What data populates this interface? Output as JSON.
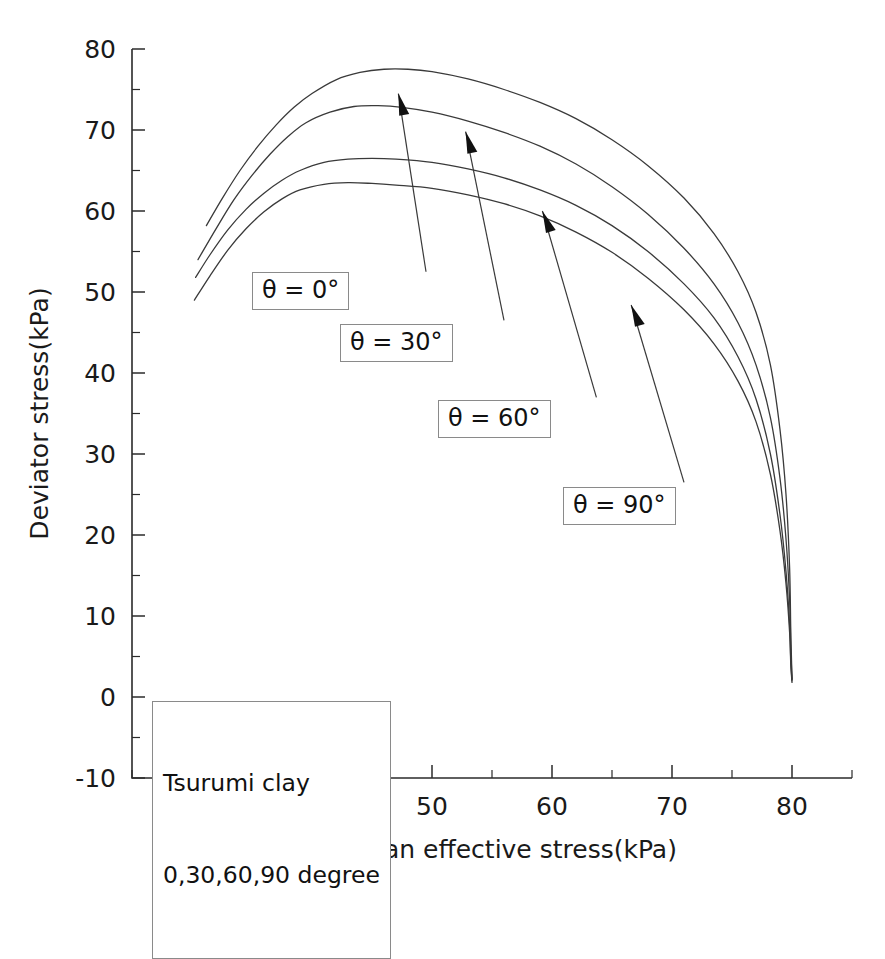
{
  "chart_data": {
    "type": "line",
    "title": "",
    "xlabel": "Mean effective stress(kPa)",
    "ylabel": "Deviator stress(kPa)",
    "xlim": [
      25,
      85
    ],
    "ylim": [
      -10,
      80
    ],
    "xticks": [
      30,
      40,
      50,
      60,
      70,
      80
    ],
    "yticks": [
      -10,
      0,
      10,
      20,
      30,
      40,
      50,
      60,
      70,
      80
    ],
    "xtick_labels": [
      "30",
      "40",
      "50",
      "60",
      "70",
      "80"
    ],
    "ytick_labels": [
      "-10",
      "0",
      "10",
      "20",
      "30",
      "40",
      "50",
      "60",
      "70",
      "80"
    ],
    "xminor_step": 5,
    "yminor_step": 5,
    "grid": false,
    "legend_position": "none",
    "line_color": "#3a3a3a",
    "series": [
      {
        "name": "theta = 0 degree",
        "label": "θ = 0°",
        "peak": {
          "x": 47.5,
          "y": 77.5
        },
        "points": [
          [
            31.2,
            58.2
          ],
          [
            32.5,
            61.5
          ],
          [
            34.0,
            65.0
          ],
          [
            35.5,
            68.0
          ],
          [
            37.0,
            70.6
          ],
          [
            38.5,
            72.8
          ],
          [
            40.0,
            74.5
          ],
          [
            42.0,
            76.2
          ],
          [
            44.0,
            77.1
          ],
          [
            46.0,
            77.5
          ],
          [
            48.0,
            77.5
          ],
          [
            50.0,
            77.2
          ],
          [
            53.0,
            76.3
          ],
          [
            56.0,
            75.0
          ],
          [
            59.0,
            73.4
          ],
          [
            62.0,
            71.4
          ],
          [
            65.0,
            68.8
          ],
          [
            68.0,
            65.6
          ],
          [
            71.0,
            61.6
          ],
          [
            73.5,
            57.2
          ],
          [
            75.5,
            52.5
          ],
          [
            77.0,
            47.5
          ],
          [
            78.2,
            41.0
          ],
          [
            79.0,
            33.0
          ],
          [
            79.5,
            25.0
          ],
          [
            79.8,
            16.0
          ],
          [
            79.9,
            8.0
          ],
          [
            80.0,
            2.2
          ]
        ]
      },
      {
        "name": "theta = 30 degree",
        "label": "θ = 30°",
        "peak": {
          "x": 45.5,
          "y": 73.0
        },
        "points": [
          [
            30.5,
            54.0
          ],
          [
            32.0,
            57.8
          ],
          [
            33.5,
            61.4
          ],
          [
            35.0,
            64.4
          ],
          [
            36.5,
            67.0
          ],
          [
            38.0,
            69.2
          ],
          [
            39.5,
            70.9
          ],
          [
            41.5,
            72.2
          ],
          [
            43.5,
            72.9
          ],
          [
            45.5,
            73.0
          ],
          [
            47.5,
            72.8
          ],
          [
            50.0,
            72.2
          ],
          [
            53.0,
            71.1
          ],
          [
            56.0,
            69.7
          ],
          [
            59.0,
            68.0
          ],
          [
            62.0,
            65.8
          ],
          [
            65.0,
            63.0
          ],
          [
            68.0,
            59.6
          ],
          [
            71.0,
            55.4
          ],
          [
            73.5,
            51.0
          ],
          [
            75.5,
            46.2
          ],
          [
            77.0,
            41.0
          ],
          [
            78.2,
            34.5
          ],
          [
            79.0,
            27.0
          ],
          [
            79.5,
            19.5
          ],
          [
            79.8,
            12.0
          ],
          [
            79.9,
            6.0
          ],
          [
            80.0,
            2.2
          ]
        ]
      },
      {
        "name": "theta = 60 degree",
        "label": "θ = 60°",
        "peak": {
          "x": 45.0,
          "y": 66.5
        },
        "points": [
          [
            30.3,
            51.8
          ],
          [
            31.5,
            54.6
          ],
          [
            33.0,
            57.7
          ],
          [
            34.5,
            60.2
          ],
          [
            36.0,
            62.2
          ],
          [
            37.5,
            63.8
          ],
          [
            39.0,
            65.0
          ],
          [
            41.0,
            66.0
          ],
          [
            43.0,
            66.4
          ],
          [
            45.0,
            66.5
          ],
          [
            47.0,
            66.4
          ],
          [
            50.0,
            66.0
          ],
          [
            53.0,
            65.2
          ],
          [
            56.0,
            64.1
          ],
          [
            59.0,
            62.6
          ],
          [
            62.0,
            60.7
          ],
          [
            65.0,
            58.2
          ],
          [
            68.0,
            55.0
          ],
          [
            71.0,
            51.0
          ],
          [
            73.5,
            46.8
          ],
          [
            75.5,
            42.0
          ],
          [
            77.0,
            36.8
          ],
          [
            78.2,
            30.0
          ],
          [
            79.0,
            22.5
          ],
          [
            79.5,
            15.5
          ],
          [
            79.8,
            9.0
          ],
          [
            79.9,
            4.5
          ],
          [
            80.0,
            2.0
          ]
        ]
      },
      {
        "name": "theta = 90 degree",
        "label": "θ = 90°",
        "peak": {
          "x": 43.5,
          "y": 63.5
        },
        "points": [
          [
            30.2,
            49.0
          ],
          [
            31.5,
            52.0
          ],
          [
            33.0,
            55.2
          ],
          [
            34.5,
            57.8
          ],
          [
            36.0,
            59.9
          ],
          [
            37.5,
            61.5
          ],
          [
            39.0,
            62.6
          ],
          [
            41.0,
            63.3
          ],
          [
            43.0,
            63.5
          ],
          [
            45.0,
            63.4
          ],
          [
            47.0,
            63.2
          ],
          [
            50.0,
            62.8
          ],
          [
            53.0,
            62.0
          ],
          [
            56.0,
            60.9
          ],
          [
            59.0,
            59.4
          ],
          [
            62.0,
            57.4
          ],
          [
            65.0,
            54.9
          ],
          [
            68.0,
            51.7
          ],
          [
            71.0,
            47.8
          ],
          [
            73.5,
            43.6
          ],
          [
            75.5,
            39.0
          ],
          [
            77.0,
            34.0
          ],
          [
            78.2,
            27.5
          ],
          [
            79.0,
            20.5
          ],
          [
            79.5,
            14.0
          ],
          [
            79.8,
            8.0
          ],
          [
            79.9,
            4.0
          ],
          [
            80.0,
            1.8
          ]
        ]
      }
    ],
    "annotations": [
      {
        "id": "ann-0",
        "text": "θ = 0°",
        "box_x": 252,
        "box_y": 272,
        "arrow_from_x": 49.5,
        "arrow_from_y": 52.5,
        "arrow_to_x": 47.2,
        "arrow_to_y": 74.5
      },
      {
        "id": "ann-30",
        "text": "θ = 30°",
        "box_x": 340,
        "box_y": 324,
        "arrow_from_x": 56.0,
        "arrow_from_y": 46.5,
        "arrow_to_x": 52.8,
        "arrow_to_y": 69.8
      },
      {
        "id": "ann-60",
        "text": "θ = 60°",
        "box_x": 438,
        "box_y": 400,
        "arrow_from_x": 63.7,
        "arrow_from_y": 37.0,
        "arrow_to_x": 59.2,
        "arrow_to_y": 60.0
      },
      {
        "id": "ann-90",
        "text": "θ = 90°",
        "box_x": 563,
        "box_y": 487,
        "arrow_from_x": 71.0,
        "arrow_from_y": 26.5,
        "arrow_to_x": 66.6,
        "arrow_to_y": 48.4
      }
    ],
    "caption": {
      "line1": "Tsurumi clay",
      "line2": "0,30,60,90 degree",
      "box_x": 152,
      "box_y": 701
    }
  }
}
